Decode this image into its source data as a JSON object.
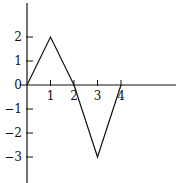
{
  "chart_data": {
    "type": "line",
    "title": "",
    "xlabel": "",
    "ylabel": "",
    "x": [
      0,
      1,
      2,
      3,
      4
    ],
    "series": [
      {
        "name": "f(x)",
        "values": [
          0,
          2,
          0,
          -3,
          0
        ]
      }
    ],
    "x_ticks": [
      "1",
      "2",
      "3",
      "4"
    ],
    "y_ticks": [
      "2",
      "1",
      "0",
      "−1",
      "−2",
      "−3"
    ],
    "xlim": [
      0,
      6
    ],
    "ylim": [
      -3.9,
      3.5
    ],
    "grid": false,
    "legend": null,
    "line_color": "#111111"
  }
}
